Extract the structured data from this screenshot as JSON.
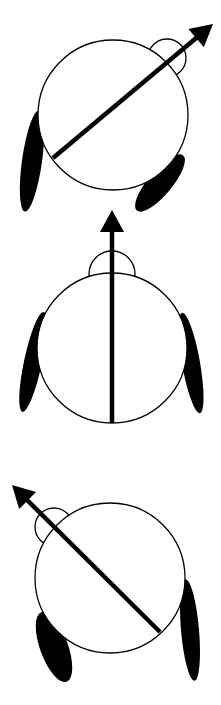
{
  "diagram": {
    "colors": {
      "background": "#ffffff",
      "stroke": "#000000",
      "fill": "#000000"
    },
    "figures": [
      {
        "id": "figure-1",
        "heading": "up-right",
        "heading_angle_deg": 40,
        "body": {
          "cx": 113,
          "cy": 115,
          "r": 75
        },
        "head": {
          "cx": 167,
          "cy": 58,
          "r": 19
        },
        "arrow": {
          "x1": 53,
          "y1": 158,
          "x2": 213,
          "y2": 24
        },
        "left_wing": {
          "cx": 32,
          "cy": 161,
          "rx": 10,
          "ry": 51,
          "rotate": 8
        },
        "right_wing": {
          "cx": 160,
          "cy": 183,
          "rx": 12,
          "ry": 36,
          "rotate": 40
        }
      },
      {
        "id": "figure-2",
        "heading": "up",
        "heading_angle_deg": 0,
        "body": {
          "cx": 112,
          "cy": 348,
          "r": 75
        },
        "head": {
          "cx": 112,
          "cy": 274,
          "r": 23
        },
        "arrow": {
          "x1": 112,
          "y1": 423,
          "x2": 112,
          "y2": 210
        },
        "left_wing": {
          "cx": 33,
          "cy": 362,
          "rx": 9,
          "ry": 51,
          "rotate": 12
        },
        "right_wing": {
          "cx": 191,
          "cy": 363,
          "rx": 9,
          "ry": 51,
          "rotate": -10
        }
      },
      {
        "id": "figure-3",
        "heading": "up-left",
        "heading_angle_deg": -45,
        "body": {
          "cx": 110,
          "cy": 578,
          "r": 75
        },
        "head": {
          "cx": 54,
          "cy": 527,
          "r": 19
        },
        "arrow": {
          "x1": 160,
          "y1": 632,
          "x2": 12,
          "y2": 485
        },
        "left_wing": {
          "cx": 54,
          "cy": 647,
          "rx": 14,
          "ry": 37,
          "rotate": -20
        },
        "right_wing": {
          "cx": 190,
          "cy": 630,
          "rx": 9,
          "ry": 51,
          "rotate": -5
        }
      }
    ]
  }
}
